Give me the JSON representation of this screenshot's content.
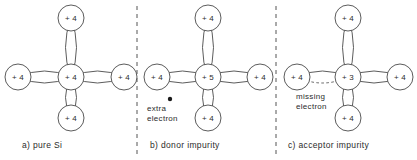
{
  "figure": {
    "type": "diagram",
    "line_color": "#4a4a4a",
    "text_color": "#2b2b2b",
    "background": "#ffffff",
    "divider_color": "#555555"
  },
  "panels": [
    {
      "id": "a",
      "caption": "a) pure Si",
      "caption_x": 22,
      "caption_y": 140,
      "center": {
        "cx": 71,
        "cy": 77,
        "label": "+ 4"
      },
      "neighbors": [
        {
          "position": "top",
          "cx": 71,
          "cy": 18,
          "label": "+ 4"
        },
        {
          "position": "left",
          "cx": 18,
          "cy": 77,
          "label": "+ 4"
        },
        {
          "position": "right",
          "cx": 124,
          "cy": 77,
          "label": "+ 4"
        },
        {
          "position": "bottom",
          "cx": 71,
          "cy": 118,
          "label": "+ 4"
        }
      ],
      "bonds": [
        {
          "position": "top",
          "style": "solid"
        },
        {
          "position": "left",
          "style": "solid"
        },
        {
          "position": "right",
          "style": "solid"
        },
        {
          "position": "bottom",
          "style": "solid"
        }
      ],
      "annotation": null,
      "electron_dot": null
    },
    {
      "id": "b",
      "caption": "b) donor impurity",
      "caption_x": 150,
      "caption_y": 140,
      "center": {
        "cx": 208,
        "cy": 77,
        "label": "+ 5"
      },
      "neighbors": [
        {
          "position": "top",
          "cx": 208,
          "cy": 18,
          "label": "+ 4"
        },
        {
          "position": "left",
          "cx": 157,
          "cy": 77,
          "label": "+ 4"
        },
        {
          "position": "right",
          "cx": 260,
          "cy": 77,
          "label": "+ 4"
        },
        {
          "position": "bottom",
          "cx": 208,
          "cy": 118,
          "label": "+ 4"
        }
      ],
      "bonds": [
        {
          "position": "top",
          "style": "solid"
        },
        {
          "position": "left",
          "style": "solid"
        },
        {
          "position": "right",
          "style": "solid"
        },
        {
          "position": "bottom",
          "style": "solid"
        }
      ],
      "annotation": {
        "line1": "extra",
        "line2": "electron",
        "x": 147,
        "y": 104
      },
      "electron_dot": {
        "cx": 170,
        "cy": 99,
        "r": 2.2
      }
    },
    {
      "id": "c",
      "caption": "c) acceptor impurity",
      "caption_x": 288,
      "caption_y": 140,
      "center": {
        "cx": 348,
        "cy": 77,
        "label": "+ 3"
      },
      "neighbors": [
        {
          "position": "top",
          "cx": 348,
          "cy": 18,
          "label": "+ 4"
        },
        {
          "position": "left",
          "cx": 297,
          "cy": 77,
          "label": "+ 4"
        },
        {
          "position": "right",
          "cx": 400,
          "cy": 77,
          "label": "+ 4"
        },
        {
          "position": "bottom",
          "cx": 348,
          "cy": 118,
          "label": "+ 4"
        }
      ],
      "bonds": [
        {
          "position": "top",
          "style": "solid"
        },
        {
          "position": "left",
          "style": "half-dashed"
        },
        {
          "position": "right",
          "style": "solid"
        },
        {
          "position": "bottom",
          "style": "solid"
        }
      ],
      "annotation": {
        "line1": "missing",
        "line2": "electron",
        "x": 296,
        "y": 92
      },
      "electron_dot": null
    }
  ],
  "dividers": [
    {
      "x": 137,
      "y1": 6,
      "y2": 154
    },
    {
      "x": 276,
      "y1": 6,
      "y2": 154
    }
  ],
  "geometry": {
    "atom_radius": 13,
    "bond_h_bulge": 12,
    "bond_v_bulge": 11
  }
}
